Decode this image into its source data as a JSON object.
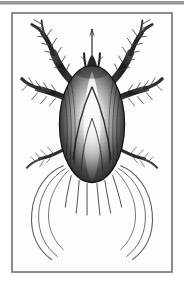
{
  "page": {
    "width_px": 184,
    "height_px": 283,
    "background_color": "#ffffff"
  },
  "top_rule": {
    "name": "top-rule",
    "color": "#9a9a9a"
  },
  "plate": {
    "frame_color": "#8d8d8d",
    "frame_border_width_px": 2,
    "interior_color": "#fdfdfd",
    "x_px": 11,
    "y_px": 12,
    "width_px": 162,
    "height_px": 261
  },
  "figure": {
    "subject": "tick-mite-dorsal-view",
    "technique": "pen-and-ink stipple and hatching",
    "orientation": "dorsal, head uppermost",
    "ink_color": "#1a1a1a",
    "midtone_color": "#6f6f6f",
    "highlight_color": "#f2f2f2",
    "parts": [
      {
        "name": "idiosoma-body",
        "shape": "egg-shaped oval",
        "center_x_px": 92,
        "center_y_px": 122,
        "width_px": 66,
        "height_px": 118,
        "shading": "dark along both lateral margins, pale median stripe, V-shaped furrows"
      },
      {
        "name": "capitulum-head",
        "shape": "narrow dark gnathosoma with slender pointed hypostome",
        "center_x_px": 92,
        "center_y_px": 52
      },
      {
        "name": "leg-pair-i-left",
        "shape": "thick segmented limb raised and curving outward, spiny setae",
        "side": "left"
      },
      {
        "name": "leg-pair-i-right",
        "shape": "thick segmented limb raised and curving outward, spiny setae",
        "side": "right"
      },
      {
        "name": "leg-pair-ii-left",
        "shape": "segmented limb projecting laterally with bristles",
        "side": "left"
      },
      {
        "name": "leg-pair-ii-right",
        "shape": "segmented limb projecting laterally with bristles",
        "side": "right"
      },
      {
        "name": "leg-pair-iii-left",
        "shape": "short segmented limb at mid-body",
        "side": "left"
      },
      {
        "name": "leg-pair-iii-right",
        "shape": "short segmented limb at mid-body",
        "side": "right"
      },
      {
        "name": "leg-pair-iv-left",
        "shape": "very long whip-like trailing leg sweeping down and out",
        "side": "left"
      },
      {
        "name": "leg-pair-iv-right",
        "shape": "very long whip-like trailing leg sweeping down and out",
        "side": "right"
      },
      {
        "name": "posterior-setae",
        "shape": "fine bristles fringing the rear margin of the body"
      }
    ]
  }
}
